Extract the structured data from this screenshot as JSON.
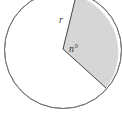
{
  "figure": {
    "type": "circle-sector",
    "labels": {
      "radius": "r",
      "angle": "n°"
    },
    "colors": {
      "circle_stroke": "#777777",
      "sector_fill": "#d6d6d6",
      "background": "#ffffff"
    }
  }
}
